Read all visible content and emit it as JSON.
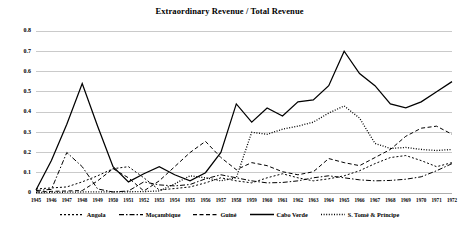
{
  "chart_data": {
    "type": "line",
    "title": "Extraordinary Revenue / Total Revenue",
    "xlabel": "",
    "ylabel": "",
    "ylim": [
      0,
      0.8
    ],
    "ytick_labels": [
      "0",
      "0.1",
      "0.2",
      "0.3",
      "0.4",
      "0.5",
      "0.6",
      "0.7",
      "0.8"
    ],
    "ytick_values": [
      0,
      0.1,
      0.2,
      0.3,
      0.4,
      0.5,
      0.6,
      0.7,
      0.8
    ],
    "grid": true,
    "legend_position": "bottom",
    "x": [
      1945,
      1946,
      1947,
      1948,
      1949,
      1950,
      1951,
      1952,
      1953,
      1954,
      1955,
      1956,
      1957,
      1958,
      1959,
      1960,
      1961,
      1962,
      1963,
      1964,
      1965,
      1966,
      1967,
      1968,
      1969,
      1970,
      1971,
      1972
    ],
    "categories": [
      "1945",
      "1946",
      "1947",
      "1948",
      "1949",
      "1950",
      "1951",
      "1952",
      "1953",
      "1954",
      "1955",
      "1956",
      "1957",
      "1958",
      "1959",
      "1960",
      "1961",
      "1962",
      "1963",
      "1964",
      "1965",
      "1966",
      "1967",
      "1968",
      "1969",
      "1970",
      "1971",
      "1972"
    ],
    "series": [
      {
        "name": "Angola",
        "dash": "2,2",
        "width": 1.0,
        "values": [
          0.02,
          0.025,
          0.03,
          0.055,
          0.085,
          0.12,
          0.13,
          0.075,
          0.015,
          0.022,
          0.03,
          0.05,
          0.075,
          0.06,
          0.05,
          0.075,
          0.095,
          0.075,
          0.06,
          0.07,
          0.085,
          0.11,
          0.145,
          0.175,
          0.185,
          0.16,
          0.13,
          0.15
        ]
      },
      {
        "name": "Moçambique",
        "dash": "5,2,1.5,2",
        "width": 1.0,
        "values": [
          0.012,
          0.018,
          0.2,
          0.13,
          0.02,
          0.005,
          0.01,
          0.055,
          0.04,
          0.035,
          0.042,
          0.07,
          0.09,
          0.075,
          0.06,
          0.05,
          0.052,
          0.06,
          0.075,
          0.085,
          0.075,
          0.065,
          0.06,
          0.062,
          0.068,
          0.08,
          0.11,
          0.145
        ]
      },
      {
        "name": "Guiné",
        "dash": "4,2.5",
        "width": 1.0,
        "values": [
          0.005,
          0.008,
          0.01,
          0.012,
          0.06,
          0.12,
          0.075,
          0.01,
          0.06,
          0.13,
          0.2,
          0.255,
          0.175,
          0.115,
          0.15,
          0.135,
          0.105,
          0.09,
          0.105,
          0.17,
          0.15,
          0.135,
          0.175,
          0.215,
          0.28,
          0.32,
          0.33,
          0.29
        ]
      },
      {
        "name": "Cabo Verde",
        "dash": "none",
        "width": 1.25,
        "values": [
          0.015,
          0.16,
          0.34,
          0.54,
          0.33,
          0.13,
          0.055,
          0.095,
          0.13,
          0.09,
          0.06,
          0.1,
          0.2,
          0.44,
          0.35,
          0.42,
          0.38,
          0.45,
          0.46,
          0.53,
          0.7,
          0.59,
          0.53,
          0.44,
          0.42,
          0.45,
          0.5,
          0.55
        ]
      },
      {
        "name": "S. Tomé & Príncipe",
        "dash": "1,1.6",
        "width": 1.3,
        "values": [
          0.002,
          0.003,
          0.004,
          0.005,
          0.006,
          0.006,
          0.006,
          0.007,
          0.01,
          0.045,
          0.085,
          0.075,
          0.06,
          0.075,
          0.3,
          0.29,
          0.315,
          0.33,
          0.35,
          0.395,
          0.43,
          0.37,
          0.245,
          0.22,
          0.225,
          0.215,
          0.21,
          0.215
        ]
      }
    ]
  },
  "legend": {
    "items": [
      {
        "label": "Angola"
      },
      {
        "label": "Moçambique"
      },
      {
        "label": "Guiné"
      },
      {
        "label": "Cabo Verde"
      },
      {
        "label": "S. Tomé & Príncipe"
      }
    ]
  }
}
